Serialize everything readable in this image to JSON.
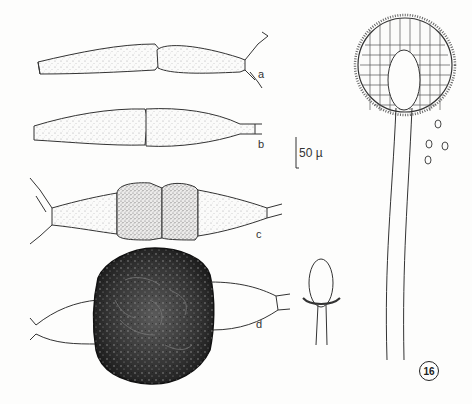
{
  "figure": {
    "number": "16",
    "scale_bar": "50 µ",
    "panel_labels": [
      "a",
      "b",
      "c",
      "d"
    ],
    "colors": {
      "ink": "#333333",
      "stipple_light": "#bfbfbf",
      "stipple_dark": "#7a7a7a",
      "spore_dark": "#2a2a2a",
      "background": "#fdfdfc"
    }
  }
}
